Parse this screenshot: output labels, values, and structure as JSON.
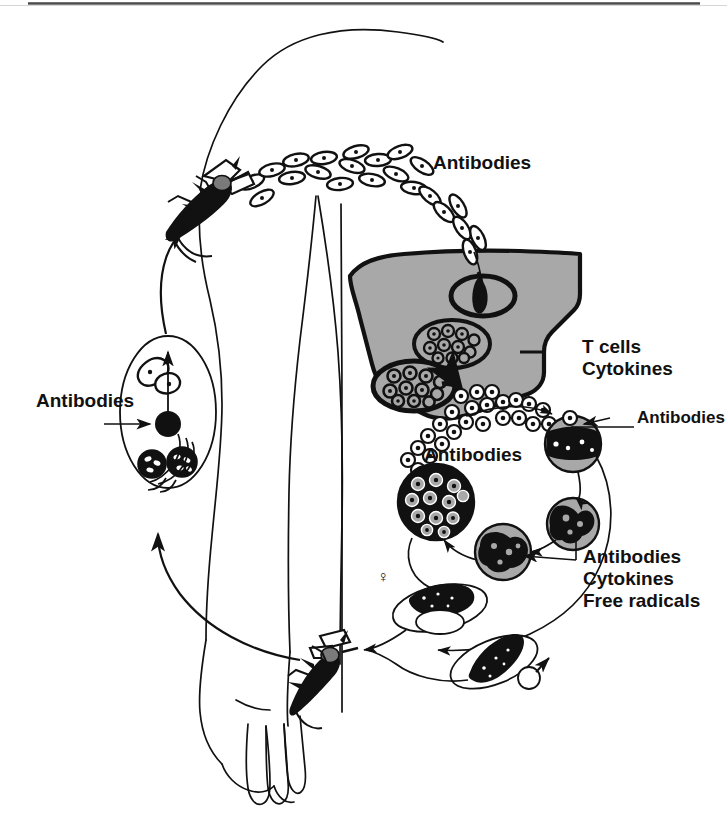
{
  "figure": {
    "domain": "diagram",
    "background_color": "#ffffff",
    "ink_color": "#111111",
    "liver_fill": "#a8a8a8",
    "cell_fill": "#9a9a9a"
  },
  "labels": {
    "antibodies_top": "Antibodies",
    "antibodies_left": "Antibodies",
    "antibodies_middle": "Antibodies",
    "antibodies_right": "Antibodies",
    "t_cells": "T cells",
    "cytokines": "Cytokines",
    "effectors_line1": "Antibodies",
    "effectors_line2": "Cytokines",
    "effectors_line3": "Free radicals",
    "female_symbol": "♀",
    "male_symbol": "♂"
  },
  "structures": {
    "human_body": "human torso arm and hand outline, side view",
    "liver": "gray filled liver organ with thick black outline",
    "mosquito_top": "mosquito biting shoulder, injecting sporozoites",
    "mosquito_bottom": "mosquito biting arm, taking up gametocytes",
    "sporozoite_chain": "chain of sporozoites travelling from skin to liver",
    "liver_sporozoite": "single sporozoite inside circled hepatocyte",
    "liver_schizont_upper": "oval hepatic schizont packed with merozoites",
    "liver_schizont_lower": "oval hepatic schizont rupturing and releasing merozoites",
    "merozoite_stream": "stream of free merozoites entering blood stream",
    "erythrocytic_cycle": "four infected red blood cells in ring-trophozoite-schizont cycle",
    "mosquito_midgut": "oval mosquito gut containing ookinete, oocyst and sporozoite-filled oocysts",
    "gametocyte_female": "female gametocyte in red blood cell",
    "gametocyte_male": "male gametocyte in red blood cell"
  },
  "counts": {
    "sporozoites_in_chain": 22,
    "erythrocytic_stages": 4,
    "liver_schizonts": 2,
    "mosquitoes": 2
  }
}
